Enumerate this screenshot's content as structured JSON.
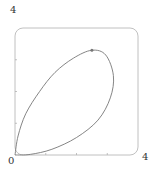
{
  "chart_data": {
    "type": "line",
    "title": "",
    "xlabel": "",
    "ylabel": "",
    "xlim": [
      0,
      4
    ],
    "ylim": [
      0,
      4
    ],
    "x_tick_labels": [
      "0",
      "4"
    ],
    "y_tick_labels": [
      "4"
    ],
    "x_minor_ticks": [
      1,
      2,
      3
    ],
    "y_minor_ticks": [
      1,
      2,
      3
    ],
    "grid": false,
    "legend": null,
    "series": [
      {
        "name": "closed loop curve",
        "closed": true,
        "points": [
          [
            0.0,
            0.0
          ],
          [
            0.1,
            0.6
          ],
          [
            0.35,
            1.3
          ],
          [
            0.8,
            2.0
          ],
          [
            1.3,
            2.6
          ],
          [
            1.9,
            3.05
          ],
          [
            2.5,
            3.3
          ],
          [
            2.95,
            3.15
          ],
          [
            3.2,
            2.5
          ],
          [
            3.1,
            1.8
          ],
          [
            2.7,
            1.1
          ],
          [
            2.0,
            0.55
          ],
          [
            1.2,
            0.18
          ],
          [
            0.5,
            0.02
          ],
          [
            0.0,
            0.0
          ]
        ],
        "marker": {
          "x": 2.5,
          "y": 3.3
        }
      }
    ],
    "frame": {
      "rounded_corners": true
    }
  },
  "labels": {
    "origin": "0",
    "x_max": "4",
    "y_max": "4"
  },
  "colors": {
    "curve": "#777777",
    "frame": "#b0b0b0",
    "text": "#333333"
  }
}
